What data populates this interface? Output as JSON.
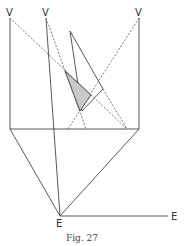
{
  "figure": {
    "caption": "Fig. 27",
    "labels": {
      "v1": "V",
      "v2": "V",
      "v3": "V",
      "e_bottom": "E",
      "e_right": "E"
    },
    "colors": {
      "line": "#444444",
      "shade": "#c8c8c8"
    }
  }
}
